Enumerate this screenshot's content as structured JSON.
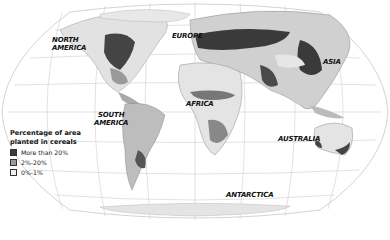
{
  "map": {
    "title": "World cereal planting map",
    "projection": "Robinson-like pseudocylindrical",
    "continent_labels": {
      "north_america": "NORTH\nAMERICA",
      "south_america": "SOUTH\nAMERICA",
      "europe": "EUROPE",
      "africa": "AFRICA",
      "asia": "ASIA",
      "australia": "AUSTRALIA",
      "antarctica": "ANTARCTICA"
    }
  },
  "legend": {
    "title_line1": "Percentage of area",
    "title_line2": "planted in cereals",
    "items": [
      {
        "label": "More than 20%",
        "color": "#3a3a3a"
      },
      {
        "label": "2%-20%",
        "color": "#9a9a9a"
      },
      {
        "label": "0%-1%",
        "color": "#f0f0f0"
      }
    ]
  },
  "colors": {
    "land_light": "#e6e6e6",
    "land_mid": "#a8a8a8",
    "land_dark": "#3c3c3c",
    "graticule": "#c8c8c8",
    "ocean": "#ffffff"
  }
}
